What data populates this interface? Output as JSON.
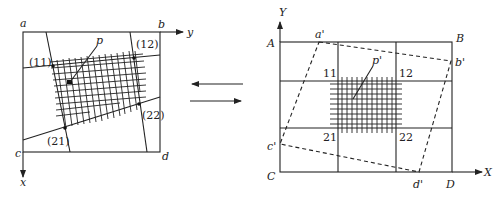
{
  "left_diagram": {
    "corners": {
      "a": "a",
      "b": "b",
      "c": "c",
      "d": "d"
    },
    "axes": {
      "horizontal": "y",
      "vertical": "x"
    },
    "control_points": [
      "(11)",
      "(12)",
      "(21)",
      "(22)"
    ],
    "point_label": "p"
  },
  "right_diagram": {
    "corners": {
      "A": "A",
      "B": "B",
      "C": "C",
      "D": "D"
    },
    "axes": {
      "horizontal": "X",
      "vertical": "Y"
    },
    "mapped_corners": {
      "a": "a'",
      "b": "b'",
      "c": "c'",
      "d": "d'"
    },
    "control_points": [
      "11",
      "12",
      "21",
      "22"
    ],
    "point_label": "p'"
  },
  "arrows": {
    "top": "left",
    "bottom": "right"
  }
}
